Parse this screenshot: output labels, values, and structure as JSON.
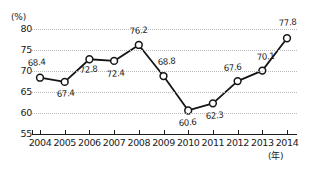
{
  "chart_data": {
    "type": "line",
    "title": "",
    "xlabel": "(年)",
    "ylabel": "(%)",
    "categories": [
      "2004",
      "2005",
      "2006",
      "2007",
      "2008",
      "2009",
      "2010",
      "2011",
      "2012",
      "2013",
      "2014"
    ],
    "values": [
      68.4,
      67.4,
      72.8,
      72.4,
      76.2,
      68.8,
      60.6,
      62.3,
      67.6,
      70.1,
      77.8
    ],
    "point_labels": [
      "68.4",
      "67.4",
      "72.8",
      "72.4",
      "76.2",
      "68.8",
      "60.6",
      "62.3",
      "67.6",
      "70.1",
      "77.8"
    ],
    "label_positions": [
      "above",
      "below",
      "below",
      "below",
      "above",
      "above",
      "below",
      "below",
      "above",
      "above",
      "above"
    ],
    "ylim": [
      55,
      80
    ],
    "yticks": [
      "55",
      "60",
      "65",
      "70",
      "75",
      "80"
    ],
    "ytick_values": [
      55,
      60,
      65,
      70,
      75,
      80
    ],
    "gridline_values": [
      60,
      65,
      70,
      75,
      80
    ],
    "grid": true,
    "legend": "none",
    "series": [
      {
        "name": "",
        "values": [
          68.4,
          67.4,
          72.8,
          72.4,
          76.2,
          68.8,
          60.6,
          62.3,
          67.6,
          70.1,
          77.8
        ]
      }
    ],
    "colors": {
      "line": "#151515",
      "marker_fill": "#ffffff",
      "marker_stroke": "#151515",
      "grid": "#b9b9b9",
      "axis": "#1a1a1a",
      "text": "#1a1a1a",
      "background": "#ffffff"
    }
  }
}
